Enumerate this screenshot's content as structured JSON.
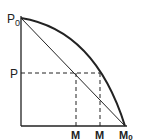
{
  "diagram": {
    "type": "production-possibility-curve",
    "labels": {
      "p0": "P",
      "p0_sub": "0",
      "p": "P",
      "m1": "M",
      "m2": "M",
      "m0": "M",
      "m0_sub": "0"
    },
    "colors": {
      "ink": "#222222",
      "background": "#ffffff"
    }
  }
}
